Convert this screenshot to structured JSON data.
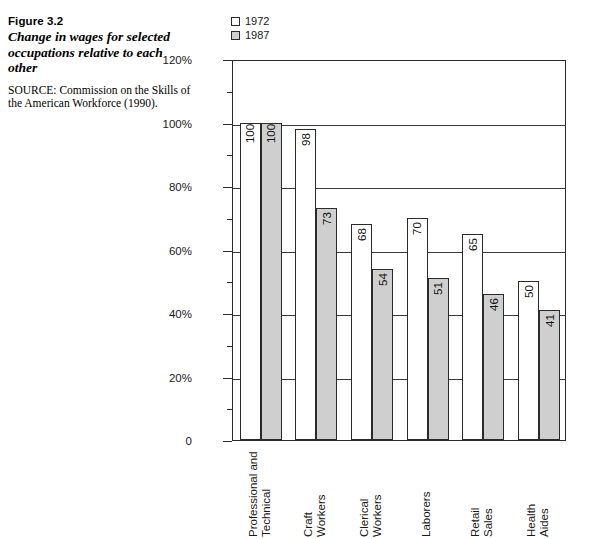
{
  "figure": {
    "number": "Figure 3.2",
    "title": "Change in wages for selected occupations relative to each other",
    "source": "SOURCE: Commission on the Skills of the American Workforce (1990)."
  },
  "legend": {
    "position": "top-left-of-plot",
    "items": [
      {
        "label": "1972",
        "color": "#ffffff"
      },
      {
        "label": "1987",
        "color": "#cfcfcf"
      }
    ]
  },
  "chart_data": {
    "type": "bar",
    "title": "Change in wages for selected occupations relative to each other",
    "xlabel": "",
    "ylabel": "",
    "ylim": [
      0,
      120
    ],
    "ytick_labels": [
      "0",
      "20%",
      "40%",
      "60%",
      "80%",
      "100%",
      "120%"
    ],
    "ytick_values": [
      0,
      20,
      40,
      60,
      80,
      100,
      120
    ],
    "yminor_values": [
      10,
      30,
      50,
      70,
      90,
      110
    ],
    "grid": true,
    "legend_position": "above-plot-left",
    "categories": [
      "Professional and Technical",
      "Craft Workers",
      "Clerical Workers",
      "Laborers",
      "Retail Sales",
      "Health Aides"
    ],
    "category_lines": [
      [
        "Professional and",
        "Technical"
      ],
      [
        "Craft",
        "Workers"
      ],
      [
        "Clerical",
        "Workers"
      ],
      [
        "Laborers"
      ],
      [
        "Retail",
        "Sales"
      ],
      [
        "Health",
        "Aides"
      ]
    ],
    "series": [
      {
        "name": "1972",
        "color": "#ffffff",
        "values": [
          100,
          98,
          68,
          70,
          65,
          50
        ]
      },
      {
        "name": "1987",
        "color": "#cfcfcf",
        "values": [
          100,
          73,
          54,
          51,
          46,
          41
        ]
      }
    ]
  }
}
